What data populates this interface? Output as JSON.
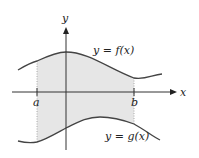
{
  "diagram": {
    "type": "area between curves",
    "axes": {
      "x_label": "x",
      "y_label": "y"
    },
    "curves": [
      {
        "name": "upper",
        "label": "y = f(x)"
      },
      {
        "name": "lower",
        "label": "y = g(x)"
      }
    ],
    "bounds": {
      "left": "a",
      "right": "b"
    },
    "colors": {
      "region_fill": "#e6e6e6",
      "curve": "#444444",
      "axis": "#333333",
      "boundary": "#999999"
    }
  }
}
